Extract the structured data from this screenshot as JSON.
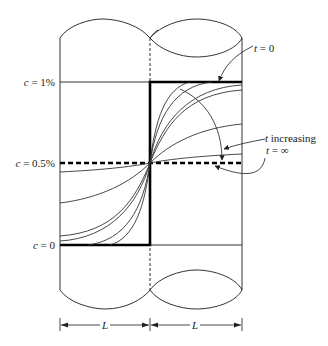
{
  "diagram": {
    "y_labels": {
      "top": {
        "var": "c",
        "text": " = 1%"
      },
      "mid": {
        "var": "c",
        "text": " = 0.5%"
      },
      "bottom": {
        "var": "c",
        "text": " = 0"
      }
    },
    "annotations": {
      "t0": {
        "var": "t",
        "text": " = 0"
      },
      "t_increasing": {
        "var": "t",
        "text": " increasing"
      },
      "t_inf": {
        "var": "t",
        "text": " = ∞"
      }
    },
    "dimension_labels": {
      "left": "L",
      "right": "L"
    },
    "profiles": {
      "description": "Concentration profiles c(x,t) across the interface at x=0; initial step from 1% to 0 flattens toward uniform 0.5% as t increases",
      "initial": {
        "left": 0.0,
        "right": 1.0
      },
      "final": 0.5
    }
  }
}
